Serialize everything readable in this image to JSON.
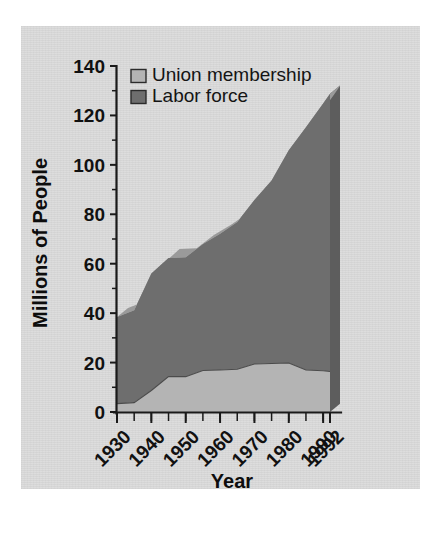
{
  "figure": {
    "background_color": "#ffffff",
    "panel_color": "#dcdcdc"
  },
  "chart_data": {
    "type": "area",
    "title": "",
    "xlabel": "Year",
    "ylabel": "Millions of People",
    "xlim": [
      1930,
      1992
    ],
    "ylim": [
      0,
      140
    ],
    "grid": false,
    "stacked": true,
    "legend_position": "upper left",
    "x_tick_labels": [
      "1930",
      "1940",
      "1950",
      "1960",
      "1970",
      "1980",
      "1990",
      "1992"
    ],
    "x_tick_values": [
      1930,
      1940,
      1950,
      1960,
      1970,
      1980,
      1990,
      1992
    ],
    "x_minor_tick_step": 5,
    "y_tick_labels": [
      "0",
      "20",
      "40",
      "60",
      "80",
      "100",
      "120",
      "140"
    ],
    "y_tick_values": [
      0,
      20,
      40,
      60,
      80,
      100,
      120,
      140
    ],
    "y_minor_tick_step": 10,
    "x": [
      1930,
      1935,
      1940,
      1945,
      1950,
      1955,
      1960,
      1965,
      1970,
      1975,
      1980,
      1985,
      1990,
      1992
    ],
    "series": [
      {
        "name": "Union membership",
        "color": "#b4b4b4",
        "values": [
          3.4,
          3.8,
          8.7,
          14.3,
          14.3,
          16.8,
          17.0,
          17.3,
          19.4,
          19.6,
          19.8,
          17.0,
          16.7,
          16.4
        ]
      },
      {
        "name": "Labor force",
        "color": "#6e6e6e",
        "values": [
          35.0,
          37.4,
          47.3,
          48.0,
          48.3,
          51.2,
          55.1,
          59.6,
          66.4,
          74.1,
          86.1,
          98.2,
          108.1,
          112.4
        ]
      }
    ],
    "totals": [
      38.4,
      41.2,
      56.0,
      62.3,
      62.6,
      68.0,
      72.1,
      76.9,
      85.8,
      93.7,
      105.9,
      115.2,
      124.8,
      128.8
    ],
    "three_d": true,
    "top_face_color": "#9a9a9a",
    "side_wall_color": "#5d5d5d"
  },
  "legend": {
    "items": [
      {
        "label": "Union membership",
        "color": "#b4b4b4"
      },
      {
        "label": "Labor force",
        "color": "#6e6e6e"
      }
    ]
  },
  "axes": {
    "y_title": "Millions of People",
    "x_title": "Year"
  }
}
